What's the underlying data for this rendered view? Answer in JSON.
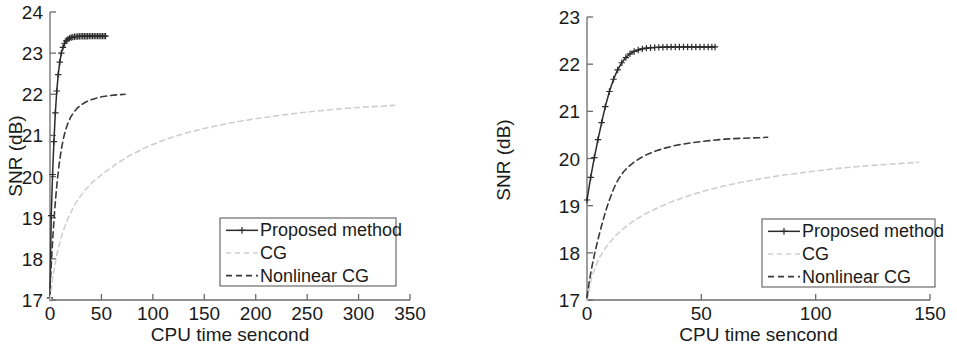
{
  "figure": {
    "panel_count": 2,
    "top_cropped_caption_fragments": [
      "",
      "",
      "",
      ""
    ]
  },
  "chart_data": [
    {
      "id": "left",
      "type": "line",
      "title": "",
      "xlabel": "CPU time sencond",
      "ylabel": "SNR (dB)",
      "xlim": [
        0,
        350
      ],
      "ylim": [
        17,
        24
      ],
      "xticks": [
        0,
        50,
        100,
        150,
        200,
        250,
        300,
        350
      ],
      "yticks": [
        17,
        18,
        19,
        20,
        21,
        22,
        23,
        24
      ],
      "grid": false,
      "legend_position": "lower right",
      "series": [
        {
          "name": "Proposed method",
          "style": "solid-plus-markers",
          "color": "#2b2b2b",
          "marker": "+",
          "x": [
            0.0,
            1.2,
            2.5,
            3.8,
            5.2,
            6.6,
            8.0,
            9.5,
            11.0,
            12.6,
            14.2,
            15.8,
            17.4,
            19.0,
            20.6,
            22.2,
            23.8,
            25.4,
            27.0,
            28.6,
            30.2,
            31.8,
            33.4,
            35.0,
            36.6,
            38.2,
            39.8,
            41.4,
            43.0,
            44.6,
            46.2,
            47.8,
            49.4,
            51.0,
            52.6,
            54.0
          ],
          "y": [
            17.05,
            19.05,
            20.05,
            20.85,
            21.55,
            22.08,
            22.48,
            22.78,
            23.0,
            23.14,
            23.24,
            23.3,
            23.34,
            23.365,
            23.38,
            23.39,
            23.398,
            23.402,
            23.405,
            23.407,
            23.409,
            23.41,
            23.411,
            23.412,
            23.412,
            23.413,
            23.413,
            23.413,
            23.414,
            23.414,
            23.414,
            23.414,
            23.414,
            23.414,
            23.414,
            23.414
          ]
        },
        {
          "name": "CG",
          "style": "dotted-light",
          "color": "#cfcfcf",
          "marker": "none",
          "x": [
            0.0,
            3.0,
            7.0,
            12.0,
            18.0,
            25.0,
            33.0,
            42.0,
            52.0,
            64.0,
            78.0,
            94.0,
            112.0,
            132.0,
            152.0,
            174.0,
            196.0,
            218.0,
            240.0,
            262.0,
            284.0,
            306.0,
            322.0,
            335.0
          ],
          "y": [
            17.0,
            17.6,
            18.15,
            18.62,
            19.02,
            19.36,
            19.64,
            19.88,
            20.08,
            20.3,
            20.52,
            20.72,
            20.9,
            21.06,
            21.18,
            21.3,
            21.39,
            21.47,
            21.54,
            21.6,
            21.65,
            21.69,
            21.71,
            21.73
          ]
        },
        {
          "name": "Nonlinear CG",
          "style": "dashed",
          "color": "#3a3a3a",
          "marker": "none",
          "x": [
            0.0,
            1.5,
            3.0,
            4.5,
            6.0,
            7.5,
            9.0,
            11.0,
            13.0,
            15.0,
            17.5,
            20.0,
            23.0,
            26.0,
            30.0,
            34.0,
            39.0,
            44.0,
            50.0,
            56.0,
            62.0,
            68.0,
            73.0
          ],
          "y": [
            17.3,
            18.0,
            18.62,
            19.16,
            19.62,
            20.0,
            20.32,
            20.66,
            20.92,
            21.12,
            21.3,
            21.44,
            21.56,
            21.65,
            21.74,
            21.8,
            21.86,
            21.9,
            21.94,
            21.96,
            21.98,
            21.99,
            22.0
          ]
        }
      ]
    },
    {
      "id": "right",
      "type": "line",
      "title": "",
      "xlabel": "CPU time sencond",
      "ylabel": "SNR (dB)",
      "xlim": [
        0,
        150
      ],
      "ylim": [
        17,
        23
      ],
      "xticks": [
        0,
        50,
        100,
        150
      ],
      "yticks": [
        17,
        18,
        19,
        20,
        21,
        22,
        23
      ],
      "grid": false,
      "legend_position": "lower right",
      "series": [
        {
          "name": "Proposed method",
          "style": "solid-plus-markers",
          "color": "#2b2b2b",
          "marker": "+",
          "x": [
            0.0,
            1.6,
            3.2,
            4.8,
            6.4,
            8.0,
            9.8,
            11.6,
            13.4,
            15.2,
            17.0,
            18.8,
            20.6,
            22.4,
            24.2,
            26.0,
            27.8,
            29.6,
            31.4,
            33.2,
            35.0,
            36.8,
            38.6,
            40.4,
            42.2,
            44.0,
            45.8,
            47.6,
            49.4,
            51.2,
            53.0,
            54.6,
            56.0
          ],
          "y": [
            19.12,
            19.6,
            20.02,
            20.4,
            20.76,
            21.1,
            21.42,
            21.68,
            21.88,
            22.03,
            22.14,
            22.22,
            22.27,
            22.3,
            22.325,
            22.34,
            22.348,
            22.353,
            22.357,
            22.36,
            22.362,
            22.363,
            22.364,
            22.364,
            22.365,
            22.365,
            22.365,
            22.365,
            22.365,
            22.365,
            22.365,
            22.365,
            22.365
          ]
        },
        {
          "name": "CG",
          "style": "dotted-light",
          "color": "#cfcfcf",
          "marker": "none",
          "x": [
            0.0,
            2.0,
            5.0,
            8.0,
            12.0,
            16.0,
            21.0,
            26.0,
            32.0,
            38.0,
            45.0,
            52.0,
            60.0,
            68.0,
            77.0,
            86.0,
            96.0,
            106.0,
            116.0,
            126.0,
            136.0,
            145.0
          ],
          "y": [
            17.0,
            17.48,
            17.86,
            18.1,
            18.34,
            18.52,
            18.7,
            18.84,
            18.98,
            19.1,
            19.22,
            19.32,
            19.42,
            19.5,
            19.58,
            19.65,
            19.71,
            19.77,
            19.82,
            19.86,
            19.89,
            19.92
          ]
        },
        {
          "name": "Nonlinear CG",
          "style": "dashed",
          "color": "#3a3a3a",
          "marker": "none",
          "x": [
            0.0,
            1.0,
            2.2,
            3.5,
            5.0,
            6.5,
            8.0,
            9.5,
            11.0,
            12.5,
            14.0,
            16.0,
            18.0,
            20.5,
            23.0,
            26.0,
            30.0,
            34.0,
            39.0,
            45.0,
            52.0,
            60.0,
            68.0,
            75.0,
            79.0
          ],
          "y": [
            17.05,
            17.4,
            17.72,
            18.02,
            18.32,
            18.6,
            18.86,
            19.08,
            19.28,
            19.45,
            19.58,
            19.72,
            19.82,
            19.92,
            20.0,
            20.08,
            20.16,
            20.22,
            20.28,
            20.33,
            20.37,
            20.41,
            20.43,
            20.44,
            20.45
          ]
        }
      ]
    }
  ],
  "legend": {
    "entries": [
      {
        "label": "Proposed method",
        "style": "solid-plus-markers"
      },
      {
        "label": "CG",
        "style": "dotted-light"
      },
      {
        "label": "Nonlinear CG",
        "style": "dashed"
      }
    ]
  },
  "colors": {
    "axis": "#6b6b6b",
    "proposed": "#2b2b2b",
    "cg": "#cfcfcf",
    "nonlinear_cg": "#3a3a3a",
    "background": "#ffffff",
    "text": "#1a1a1a"
  }
}
